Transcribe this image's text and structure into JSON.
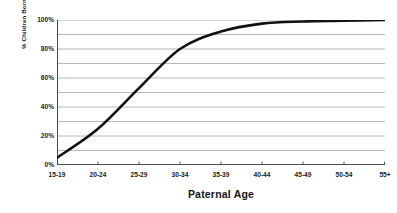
{
  "chart_data": {
    "type": "line",
    "title": "",
    "subtitle": "",
    "xlabel": "Paternal Age",
    "ylabel": "% Children Born",
    "categories": [
      "15-19",
      "20-24",
      "25-29",
      "30-34",
      "35-39",
      "40-44",
      "45-49",
      "50-54",
      "55+"
    ],
    "series": [
      {
        "name": "Cumulative % children born",
        "values": [
          5,
          25,
          53,
          80,
          92,
          97.5,
          99,
          99.5,
          100
        ]
      }
    ],
    "ylim": [
      0,
      100
    ],
    "ytick_labels": [
      "100%",
      "80%",
      "60%",
      "40%",
      "20%",
      "0%"
    ],
    "ytick_values": [
      100,
      80,
      60,
      40,
      20,
      0
    ],
    "ygrid_values": [
      100,
      90,
      80,
      70,
      60,
      50,
      40,
      30,
      20,
      10,
      0
    ],
    "grid": "horizontal",
    "legend": "none",
    "annotations": [],
    "colors": {
      "line": "#111111",
      "grid": "#a6a6a6",
      "axis": "#4d4d4d",
      "text": "#1a1a1a",
      "background": "#ffffff"
    },
    "line_width": 2.6
  }
}
